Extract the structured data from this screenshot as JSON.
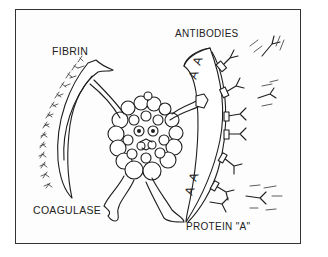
{
  "figure": {
    "type": "line-art illustration",
    "labels": {
      "fibrin": "FIBRIN",
      "antibodies": "ANTIBODIES",
      "coagulase": "COAGULASE",
      "protein_a": "PROTEIN \"A\""
    },
    "shield_marks": [
      "A",
      "A",
      "A",
      "A"
    ],
    "colors": {
      "ink": "#1e1e1e",
      "paper": "#ffffff",
      "frame": "#333333"
    }
  }
}
